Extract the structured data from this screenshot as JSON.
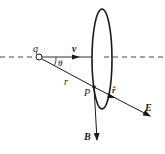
{
  "diagram": {
    "type": "physics-field-of-moving-charge",
    "labels": {
      "charge": "q",
      "velocity": "v",
      "angle": "θ",
      "distance": "r",
      "point": "P",
      "unit_vector": "r̂",
      "electric_field": "E",
      "magnetic_field": "B"
    },
    "colors": {
      "stroke": "#1a1a1a",
      "background": "#ffffff"
    }
  }
}
